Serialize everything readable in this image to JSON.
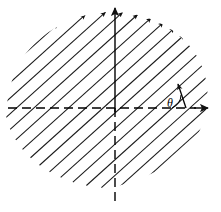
{
  "figure": {
    "type": "vector-field-diagram",
    "background_color": "#ffffff",
    "ink_color": "#1a1a1a",
    "axis_color": "#000000",
    "width": 221,
    "height": 212
  },
  "axes": {
    "origin": {
      "x": 115,
      "y": 108
    },
    "x_axis": {
      "name": "horizontal-axis",
      "style": "dashed",
      "from_x": 8,
      "to_x": 198,
      "y": 108,
      "arrow_at": "right",
      "arrow_tip_x": 210,
      "label": ""
    },
    "y_axis": {
      "name": "vertical-axis",
      "style_above_origin": "solid",
      "style_below_origin": "dashed",
      "x": 115,
      "top_y": 10,
      "bottom_y": 205,
      "arrow_at": "top",
      "arrow_tip_y": 4,
      "label": ""
    }
  },
  "angle_marker": {
    "symbol": "θ",
    "label_x": 176,
    "label_y": 106,
    "arc_radius": 22,
    "arc_start_deg": 0,
    "arc_end_deg": 72,
    "vertex_x": 162,
    "vertex_y": 108,
    "vector_angle_deg": 72,
    "vector_length": 26,
    "vector_tip_x": 170,
    "vector_tip_y": 83
  },
  "field": {
    "name": "hatched-arrow-field",
    "arrow_angle_deg": 42,
    "arrow_count": 17,
    "spacing_px": 11.6,
    "line_color": "#1a1a1a",
    "line_width": 1.05,
    "description": "Parallel arrows pointing up and to the right at about 42 degrees, filling a rounded blob shaped region",
    "region": {
      "shape": "rounded-blob",
      "center_x": 112,
      "center_y": 100,
      "radius_x": 108,
      "radius_y": 88
    },
    "arrows": [
      {
        "x1": 16,
        "y1": 122,
        "x2": 104,
        "y2": 43
      },
      {
        "x1": 12,
        "y1": 134,
        "x2": 122,
        "y2": 35
      },
      {
        "x1": 14,
        "y1": 146,
        "x2": 136,
        "y2": 36
      },
      {
        "x1": 18,
        "y1": 158,
        "x2": 148,
        "y2": 41
      },
      {
        "x1": 26,
        "y1": 168,
        "x2": 158,
        "y2": 49
      },
      {
        "x1": 36,
        "y1": 177,
        "x2": 166,
        "y2": 60
      },
      {
        "x1": 50,
        "y1": 185,
        "x2": 174,
        "y2": 73
      },
      {
        "x1": 68,
        "y1": 191,
        "x2": 180,
        "y2": 90
      },
      {
        "x1": 92,
        "y1": 194,
        "x2": 184,
        "y2": 110
      }
    ]
  },
  "caption": ""
}
